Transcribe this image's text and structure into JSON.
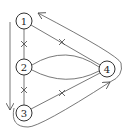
{
  "diagram": {
    "type": "graph",
    "nodes": [
      {
        "id": "1",
        "label": "1",
        "cx": 24,
        "cy": 21
      },
      {
        "id": "2",
        "label": "2",
        "cx": 24,
        "cy": 67
      },
      {
        "id": "3",
        "label": "3",
        "cx": 24,
        "cy": 113
      },
      {
        "id": "4",
        "label": "4",
        "cx": 107,
        "cy": 69
      }
    ],
    "edges": [
      {
        "from": "1",
        "to": "2",
        "style": "straight",
        "marked": true
      },
      {
        "from": "2",
        "to": "3",
        "style": "straight",
        "marked": true
      },
      {
        "from": "1",
        "to": "4",
        "style": "straight",
        "marked": true
      },
      {
        "from": "3",
        "to": "4",
        "style": "straight",
        "marked": true
      },
      {
        "from": "2",
        "to": "4",
        "style": "curved-upper",
        "marked": false
      },
      {
        "from": "2",
        "to": "4",
        "style": "curved-lower",
        "marked": false
      },
      {
        "from": "3",
        "to": "4",
        "style": "outer-loop",
        "directed": true
      },
      {
        "from": "4",
        "to": "1",
        "style": "outer-loop",
        "directed": true
      }
    ],
    "side_arrow": {
      "direction": "down",
      "from_node": "1",
      "to_node": "3"
    }
  }
}
